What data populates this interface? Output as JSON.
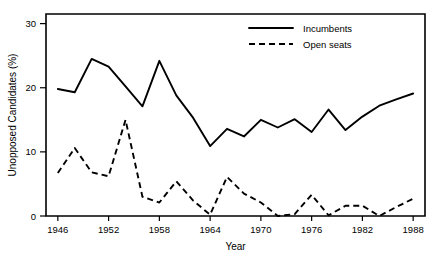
{
  "chart_data": {
    "type": "line",
    "title": "",
    "xlabel": "Year",
    "ylabel": "Unopposed Candidates (%)",
    "xlim": [
      1944.6,
      1989.4
    ],
    "ylim": [
      0,
      31.5
    ],
    "xticks": [
      1946,
      1952,
      1958,
      1964,
      1970,
      1976,
      1982,
      1988
    ],
    "xtick_labels": [
      "1946",
      "1952",
      "1958",
      "1964",
      "1970",
      "1976",
      "1982",
      "1988"
    ],
    "yticks": [
      0,
      10,
      20,
      30
    ],
    "ytick_labels": [
      "0",
      "10",
      "20",
      "30"
    ],
    "grid": false,
    "legend_position": "top-right",
    "x": [
      1946,
      1948,
      1950,
      1952,
      1954,
      1956,
      1958,
      1960,
      1962,
      1964,
      1966,
      1968,
      1970,
      1972,
      1974,
      1976,
      1978,
      1980,
      1982,
      1984,
      1986,
      1988
    ],
    "series": [
      {
        "name": "Incumbents",
        "style": "solid",
        "values": [
          19.8,
          19.3,
          24.5,
          23.3,
          20.2,
          17.1,
          24.2,
          18.8,
          15.3,
          10.9,
          13.6,
          12.4,
          15.0,
          13.8,
          15.1,
          13.1,
          16.6,
          13.4,
          15.5,
          17.2,
          18.2,
          19.1
        ]
      },
      {
        "name": "Open seats",
        "style": "dashed",
        "values": [
          6.7,
          10.6,
          6.8,
          6.2,
          15.0,
          3.0,
          2.1,
          5.4,
          2.4,
          0.2,
          6.1,
          3.5,
          2.1,
          0.0,
          0.3,
          3.3,
          0.1,
          1.6,
          1.6,
          0.0,
          1.4,
          2.7
        ]
      }
    ],
    "legend": [
      {
        "label": "Incumbents",
        "style": "solid"
      },
      {
        "label": "Open seats",
        "style": "dashed"
      }
    ]
  }
}
